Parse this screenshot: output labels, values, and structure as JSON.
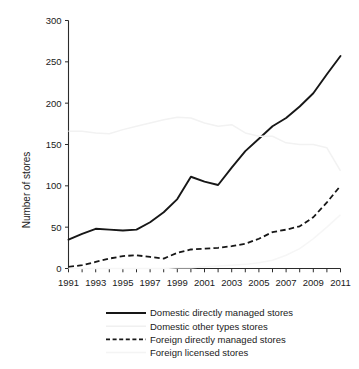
{
  "chart_data": {
    "type": "line",
    "title": "",
    "xlabel": "",
    "ylabel": "Number of stores",
    "xlim": [
      1991,
      2011
    ],
    "ylim": [
      0,
      300
    ],
    "grid": false,
    "legend_position": "below",
    "x": [
      1991,
      1992,
      1993,
      1994,
      1995,
      1996,
      1997,
      1998,
      1999,
      2000,
      2001,
      2002,
      2003,
      2004,
      2005,
      2006,
      2007,
      2008,
      2009,
      2010,
      2011
    ],
    "xtick_labels": [
      "1991",
      "1993",
      "1995",
      "1997",
      "1999",
      "2001",
      "2003",
      "2005",
      "2007",
      "2009",
      "2011"
    ],
    "xtick_values": [
      1991,
      1993,
      1995,
      1997,
      1999,
      2001,
      2003,
      2005,
      2007,
      2009,
      2011
    ],
    "ytick_labels": [
      "0",
      "50",
      "100",
      "150",
      "200",
      "250",
      "300"
    ],
    "ytick_values": [
      0,
      50,
      100,
      150,
      200,
      250,
      300
    ],
    "series": [
      {
        "name": "Domestic directly managed stores",
        "style": "solid",
        "color": "#171717",
        "values": [
          35,
          42,
          48,
          47,
          46,
          47,
          56,
          68,
          84,
          111,
          105,
          101,
          122,
          142,
          157,
          172,
          182,
          196,
          212,
          235,
          257
        ]
      },
      {
        "name": "Domestic other types stores",
        "style": "solid-faint",
        "color": "#f2f2f2",
        "values": [
          166,
          166,
          164,
          163,
          168,
          172,
          176,
          180,
          183,
          182,
          176,
          172,
          174,
          164,
          160,
          160,
          152,
          150,
          150,
          146,
          118
        ]
      },
      {
        "name": "Foreign directly managed stores",
        "style": "dashed",
        "color": "#171717",
        "values": [
          2,
          4,
          8,
          12,
          15,
          16,
          14,
          12,
          19,
          23,
          24,
          25,
          27,
          30,
          36,
          44,
          47,
          51,
          62,
          80,
          100
        ]
      },
      {
        "name": "Foreign licensed stores",
        "style": "solid-faint",
        "color": "#f6f6f6",
        "values": [
          0,
          0,
          0,
          0,
          0,
          0,
          0,
          0,
          1,
          1,
          2,
          3,
          4,
          5,
          7,
          10,
          16,
          24,
          36,
          50,
          65
        ]
      }
    ]
  },
  "axis": {
    "y_title": "Number of stores"
  },
  "legend": {
    "items": [
      {
        "label": "Domestic directly managed stores",
        "style": "solid"
      },
      {
        "label": "Domestic other types stores",
        "style": "solid-faint"
      },
      {
        "label": "Foreign directly managed stores",
        "style": "dashed"
      },
      {
        "label": "Foreign licensed stores",
        "style": "solid-faint"
      }
    ]
  }
}
